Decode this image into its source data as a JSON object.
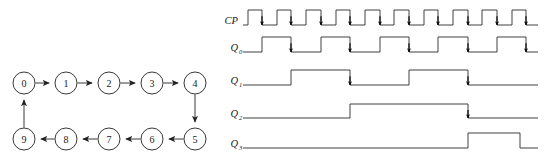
{
  "figure": {
    "title": "",
    "panels": [
      "state-transition-diagram",
      "timing-waveform-diagram"
    ]
  },
  "state_diagram": {
    "type": "directed-cycle",
    "node_radius": 11,
    "stroke_color": "#222222",
    "nodes": [
      {
        "id": "n0",
        "label": "0",
        "cx": 24,
        "cy": 83
      },
      {
        "id": "n1",
        "label": "1",
        "cx": 66,
        "cy": 83
      },
      {
        "id": "n2",
        "label": "2",
        "cx": 109,
        "cy": 83
      },
      {
        "id": "n3",
        "label": "3",
        "cx": 152,
        "cy": 83
      },
      {
        "id": "n4",
        "label": "4",
        "cx": 195,
        "cy": 83
      },
      {
        "id": "n5",
        "label": "5",
        "cx": 195,
        "cy": 139
      },
      {
        "id": "n6",
        "label": "6",
        "cx": 152,
        "cy": 139
      },
      {
        "id": "n7",
        "label": "7",
        "cx": 109,
        "cy": 139
      },
      {
        "id": "n8",
        "label": "8",
        "cx": 66,
        "cy": 139
      },
      {
        "id": "n9",
        "label": "9",
        "cx": 24,
        "cy": 139
      }
    ],
    "edges": [
      {
        "from": "n0",
        "to": "n1"
      },
      {
        "from": "n1",
        "to": "n2"
      },
      {
        "from": "n2",
        "to": "n3"
      },
      {
        "from": "n3",
        "to": "n4"
      },
      {
        "from": "n4",
        "to": "n5"
      },
      {
        "from": "n5",
        "to": "n6"
      },
      {
        "from": "n6",
        "to": "n7"
      },
      {
        "from": "n7",
        "to": "n8"
      },
      {
        "from": "n8",
        "to": "n9"
      },
      {
        "from": "n9",
        "to": "n0"
      }
    ]
  },
  "chart_data": {
    "type": "line",
    "title": "",
    "xlabel": "",
    "ylabel": "",
    "time_axis": {
      "x_start": 243,
      "x_end": 538,
      "clock_period_px": 29.5,
      "cycles": 10
    },
    "signals": [
      {
        "name": "CP",
        "label": "CP",
        "subscript": "",
        "y_high": 10,
        "y_low": 25,
        "edge_markers": "falling",
        "transitions": [
          {
            "x": 243,
            "level": 0
          },
          {
            "x": 248,
            "level": 1
          },
          {
            "x": 262,
            "level": 0
          },
          {
            "x": 277,
            "level": 1
          },
          {
            "x": 291,
            "level": 0
          },
          {
            "x": 306,
            "level": 1
          },
          {
            "x": 321,
            "level": 0
          },
          {
            "x": 336,
            "level": 1
          },
          {
            "x": 350,
            "level": 0
          },
          {
            "x": 365,
            "level": 1
          },
          {
            "x": 380,
            "level": 0
          },
          {
            "x": 394,
            "level": 1
          },
          {
            "x": 409,
            "level": 0
          },
          {
            "x": 424,
            "level": 1
          },
          {
            "x": 438,
            "level": 0
          },
          {
            "x": 453,
            "level": 1
          },
          {
            "x": 468,
            "level": 0
          },
          {
            "x": 482,
            "level": 1
          },
          {
            "x": 497,
            "level": 0
          },
          {
            "x": 512,
            "level": 1
          },
          {
            "x": 526,
            "level": 0
          },
          {
            "x": 538,
            "level": 0
          }
        ],
        "markers": [
          262,
          291,
          321,
          350,
          380,
          409,
          438,
          468,
          497,
          526
        ]
      },
      {
        "name": "Q0",
        "label": "Q",
        "subscript": "0",
        "y_high": 37,
        "y_low": 52,
        "edge_markers": "falling",
        "transitions": [
          {
            "x": 243,
            "level": 0
          },
          {
            "x": 262,
            "level": 1
          },
          {
            "x": 291,
            "level": 0
          },
          {
            "x": 321,
            "level": 1
          },
          {
            "x": 350,
            "level": 0
          },
          {
            "x": 380,
            "level": 1
          },
          {
            "x": 409,
            "level": 0
          },
          {
            "x": 438,
            "level": 1
          },
          {
            "x": 468,
            "level": 0
          },
          {
            "x": 497,
            "level": 1
          },
          {
            "x": 526,
            "level": 0
          },
          {
            "x": 538,
            "level": 0
          }
        ],
        "markers": [
          291,
          350,
          409,
          468,
          526
        ]
      },
      {
        "name": "Q1",
        "label": "Q",
        "subscript": "1",
        "y_high": 70,
        "y_low": 85,
        "edge_markers": "falling",
        "transitions": [
          {
            "x": 243,
            "level": 0
          },
          {
            "x": 291,
            "level": 1
          },
          {
            "x": 350,
            "level": 0
          },
          {
            "x": 409,
            "level": 1
          },
          {
            "x": 468,
            "level": 0
          },
          {
            "x": 538,
            "level": 0
          }
        ],
        "markers": [
          350,
          468
        ]
      },
      {
        "name": "Q2",
        "label": "Q",
        "subscript": "2",
        "y_high": 104,
        "y_low": 118,
        "edge_markers": "falling",
        "transitions": [
          {
            "x": 243,
            "level": 0
          },
          {
            "x": 350,
            "level": 1
          },
          {
            "x": 468,
            "level": 0
          },
          {
            "x": 538,
            "level": 0
          }
        ],
        "markers": [
          468
        ]
      },
      {
        "name": "Q3",
        "label": "Q",
        "subscript": "3",
        "y_high": 133,
        "y_low": 148,
        "edge_markers": "none",
        "transitions": [
          {
            "x": 243,
            "level": 0
          },
          {
            "x": 468,
            "level": 1
          },
          {
            "x": 520,
            "level": 0
          },
          {
            "x": 538,
            "level": 0
          }
        ],
        "markers": []
      }
    ]
  },
  "style": {
    "line_color": "#2a2a2a",
    "marker_color": "#000000",
    "background": "#ffffff"
  }
}
